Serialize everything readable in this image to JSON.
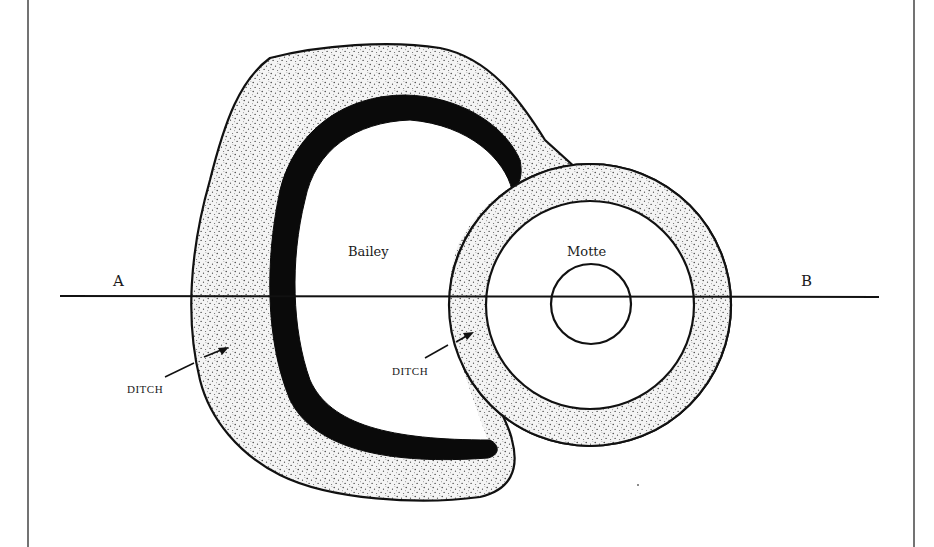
{
  "diagram": {
    "type": "plan",
    "labels": {
      "bailey": "Bailey",
      "motte": "Motte",
      "section_start": "A",
      "section_end": "B",
      "ditch_left": "DITCH",
      "ditch_right": "DITCH"
    },
    "section_line": {
      "from": "A",
      "to": "B"
    },
    "colors": {
      "stroke": "#111111",
      "rampart_fill": "#111111",
      "ditch_fill": "#efefef",
      "background": "#ffffff"
    }
  }
}
